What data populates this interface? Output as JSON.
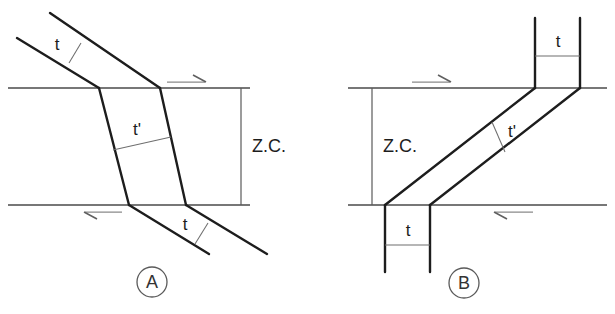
{
  "figure": {
    "background_color": "#ffffff",
    "line_color": "#1d1d1d",
    "reference_line_color": "#4a4a4a",
    "thin_line_color": "#6e6e6e"
  },
  "panels": [
    {
      "id": "A",
      "label": "A",
      "zone_label": "Z.C.",
      "thickness_outside_label": "t",
      "thickness_inside_label": "t'",
      "shear_sense_top": "dextral-arrow-right",
      "shear_sense_bottom": "arrow-left",
      "labels": {
        "t_upper": "t",
        "t_lower": "t",
        "t_prime": "t'",
        "zc": "Z.C."
      }
    },
    {
      "id": "B",
      "label": "B",
      "zone_label": "Z.C.",
      "thickness_outside_label": "t",
      "thickness_inside_label": "t'",
      "shear_sense_top": "dextral-arrow-right",
      "shear_sense_bottom": "arrow-left",
      "labels": {
        "t_upper": "t",
        "t_lower": "t",
        "t_prime": "t'",
        "zc": "Z.C."
      }
    }
  ]
}
